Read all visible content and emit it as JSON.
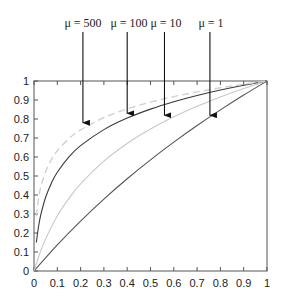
{
  "chart_data": {
    "type": "line",
    "title": "",
    "xlabel": "",
    "ylabel": "",
    "xlim": [
      0,
      1
    ],
    "ylim": [
      0,
      1
    ],
    "grid": false,
    "legend": "annotations with arrows above plot",
    "x_ticks": [
      "0",
      "0.1",
      "0.2",
      "0.3",
      "0.4",
      "0.5",
      "0.6",
      "0.7",
      "0.8",
      "0.9",
      "1"
    ],
    "y_ticks": [
      "0",
      "0.1",
      "0.2",
      "0.3",
      "0.4",
      "0.5",
      "0.6",
      "0.7",
      "0.8",
      "0.9",
      "1"
    ],
    "series": [
      {
        "name": "μ = 1",
        "style": "solid",
        "color": "#555555",
        "x": [
          0,
          0.1,
          0.2,
          0.3,
          0.4,
          0.5,
          0.6,
          0.7,
          0.8,
          0.9,
          1
        ],
        "y": [
          0,
          0.1375,
          0.263,
          0.3785,
          0.4854,
          0.585,
          0.6781,
          0.7655,
          0.848,
          0.926,
          1
        ],
        "arrow_x": 0.755,
        "arrow_tip_y": 0.82
      },
      {
        "name": "μ = 10",
        "style": "solid",
        "color": "#c8c8c8",
        "x": [
          0,
          0.025,
          0.05,
          0.1,
          0.15,
          0.2,
          0.3,
          0.4,
          0.5,
          0.6,
          0.7,
          0.8,
          0.9,
          1
        ],
        "y": [
          0,
          0.0931,
          0.1691,
          0.2891,
          0.3821,
          0.4582,
          0.5781,
          0.6712,
          0.7472,
          0.8115,
          0.8672,
          0.9163,
          0.9603,
          1
        ],
        "arrow_x": 0.56,
        "arrow_tip_y": 0.82
      },
      {
        "name": "μ = 100",
        "style": "solid",
        "color": "#3a3a3a",
        "x": [
          0.01,
          0.02,
          0.03,
          0.05,
          0.075,
          0.1,
          0.15,
          0.2,
          0.3,
          0.4,
          0.5,
          0.6,
          0.7,
          0.8,
          0.9,
          1
        ],
        "y": [
          0.1502,
          0.238,
          0.3004,
          0.3882,
          0.4637,
          0.5196,
          0.6008,
          0.6597,
          0.7441,
          0.8047,
          0.8519,
          0.8907,
          0.9236,
          0.9522,
          0.9774,
          1
        ],
        "arrow_x": 0.4,
        "arrow_tip_y": 0.83
      },
      {
        "name": "μ = 500",
        "style": "dashed",
        "color": "#d0d0d0",
        "x": [
          0.01,
          0.02,
          0.03,
          0.05,
          0.075,
          0.1,
          0.15,
          0.2,
          0.3,
          0.4,
          0.5,
          0.6,
          0.7,
          0.8,
          0.9,
          1
        ],
        "y": [
          0.2882,
          0.3857,
          0.446,
          0.5241,
          0.5873,
          0.6325,
          0.6966,
          0.7424,
          0.8071,
          0.8531,
          0.8888,
          0.918,
          0.9428,
          0.9642,
          0.9831,
          1
        ],
        "arrow_x": 0.21,
        "arrow_tip_y": 0.78
      }
    ]
  },
  "annotations": {
    "mu_500": "μ = 500",
    "mu_100": "μ = 100",
    "mu_10": "μ = 10",
    "mu_1": "μ = 1"
  }
}
